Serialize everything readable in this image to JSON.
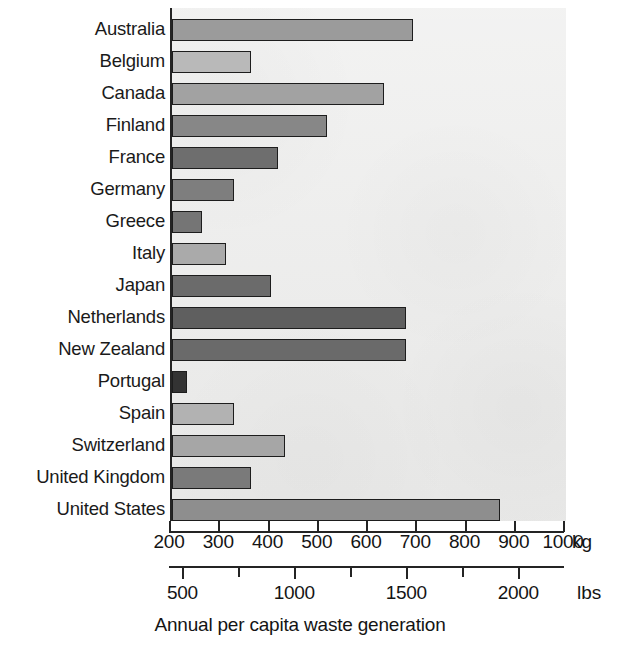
{
  "chart_data": {
    "type": "bar",
    "orientation": "horizontal",
    "title": "",
    "xlabel": "Annual per capita waste generation",
    "ylabel": "",
    "grid": false,
    "legend": null,
    "categories": [
      "Australia",
      "Belgium",
      "Canada",
      "Finland",
      "France",
      "Germany",
      "Greece",
      "Italy",
      "Japan",
      "Netherlands",
      "New Zealand",
      "Portugal",
      "Spain",
      "Switzerland",
      "United Kingdom",
      "United States"
    ],
    "values": [
      690,
      360,
      630,
      515,
      415,
      325,
      260,
      310,
      400,
      675,
      675,
      230,
      325,
      430,
      360,
      865
    ],
    "value_unit": "kg",
    "bar_fills": [
      "#9b9b9b",
      "#b9b9b9",
      "#a2a2a2",
      "#878787",
      "#6e6e6e",
      "#7e7e7e",
      "#757575",
      "#aaaaaa",
      "#6b6b6b",
      "#5f5f5f",
      "#6a6a6a",
      "#333333",
      "#b2b2b2",
      "#a6a6a6",
      "#7a7a7a",
      "#8e8e8e"
    ],
    "axes": [
      {
        "name": "kg",
        "unit_label": "kg",
        "min": 200,
        "max": 1000,
        "ticks": [
          200,
          300,
          400,
          500,
          600,
          700,
          800,
          900,
          1000
        ],
        "tick_labels": [
          "200",
          "300",
          "400",
          "500",
          "600",
          "700",
          "800",
          "900",
          "1000"
        ]
      },
      {
        "name": "lbs",
        "unit_label": "lbs",
        "min": 440,
        "max": 2200,
        "ticks": [
          500,
          750,
          1000,
          1250,
          1500,
          1750,
          2000,
          2250
        ],
        "labeled_ticks": [
          500,
          1000,
          1500,
          2000
        ],
        "tick_labels": [
          "500",
          "1000",
          "1500",
          "2000"
        ]
      }
    ],
    "colors": {
      "panel_background": "#ececeb",
      "axis": "#242424",
      "text": "#141414",
      "page_background": "#ffffff"
    }
  }
}
